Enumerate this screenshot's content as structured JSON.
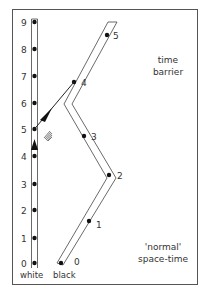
{
  "diagram": {
    "region_labels": {
      "time_barrier_line1": "time",
      "time_barrier_line2": "barrier",
      "normal_line1": "'normal'",
      "normal_line2": "space-time"
    },
    "worldlines": {
      "white": {
        "label": "white",
        "ticks": [
          "0",
          "1",
          "2",
          "3",
          "4",
          "5",
          "6",
          "7",
          "8",
          "9"
        ]
      },
      "black": {
        "label": "black",
        "ticks": [
          "0",
          "1",
          "2",
          "3",
          "4",
          "5"
        ]
      }
    },
    "icons": {
      "up_arrow": "arrowhead-up-icon",
      "diagonal_arrow": "arrowhead-diagonal-icon",
      "hatch": "hatched-mark-icon"
    },
    "colors": {
      "line": "#333333",
      "dot": "#111111",
      "frame": "#555555",
      "background": "#ffffff"
    }
  }
}
